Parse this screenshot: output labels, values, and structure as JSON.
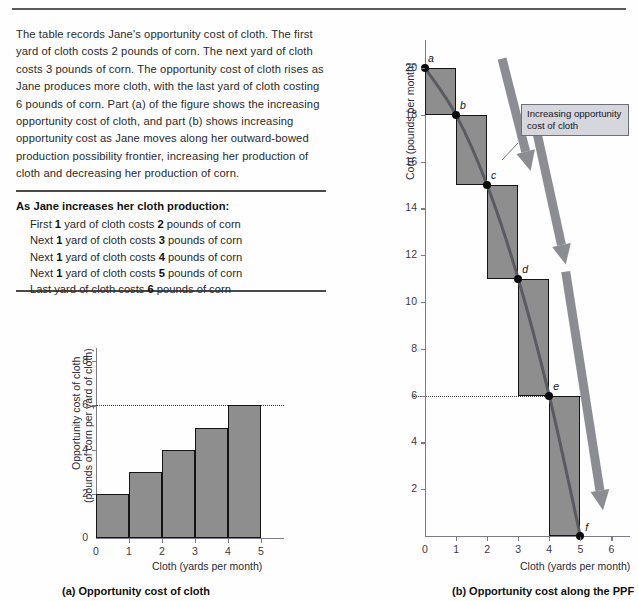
{
  "intro": {
    "paragraph": "The table records Jane's opportunity cost of cloth. The first yard of cloth costs 2 pounds of corn. The next yard of cloth costs 3 pounds of corn. The opportunity cost of cloth rises as Jane produces more cloth, with the last yard of cloth costing 6 pounds of corn. Part (a) of the figure shows the increasing opportunity cost of cloth, and part (b) shows increasing opportunity cost as Jane moves along her outward-bowed production possibility frontier, increasing her production of cloth and decreasing her production of corn."
  },
  "cost_table": {
    "heading": "As Jane increases her cloth production:",
    "rows": [
      {
        "prefix": "First",
        "qty": "1",
        "mid": "yard of cloth costs",
        "cost": "2",
        "suffix": "pounds of corn"
      },
      {
        "prefix": "Next",
        "qty": "1",
        "mid": "yard of cloth costs",
        "cost": "3",
        "suffix": "pounds of corn"
      },
      {
        "prefix": "Next",
        "qty": "1",
        "mid": "yard of cloth costs",
        "cost": "4",
        "suffix": "pounds of corn"
      },
      {
        "prefix": "Next",
        "qty": "1",
        "mid": "yard of cloth costs",
        "cost": "5",
        "suffix": "pounds of corn"
      },
      {
        "prefix": "Last",
        "qty": "",
        "mid": "yard of cloth costs",
        "cost": "6",
        "suffix": "pounds of corn"
      }
    ]
  },
  "panel_a": {
    "caption": "(a) Opportunity cost of cloth",
    "xlabel": "Cloth (yards per month)",
    "ylabel_line1": "Opportunity cost of cloth",
    "ylabel_line2": "(pounds of corn per yard of cloth)"
  },
  "panel_b": {
    "caption": "(b) Opportunity cost along the PPF",
    "xlabel": "Cloth (yards per month)",
    "ylabel": "Corn (pounds per month)",
    "callout": "Increasing opportunity cost of cloth"
  },
  "colors": {
    "bar_fill": "#8e8e8e",
    "bar_stroke": "#141414",
    "ppf_curve": "#5a5a62",
    "arrow": "#8c8c93",
    "callout_bg": "#d6d6dd",
    "axis": "#7b7b8a"
  },
  "chart_data": [
    {
      "type": "bar",
      "id": "panel-a",
      "title": "(a) Opportunity cost of cloth",
      "xlabel": "Cloth (yards per month)",
      "ylabel": "Opportunity cost of cloth (pounds of corn per yard of cloth)",
      "categories": [
        "0-1",
        "1-2",
        "2-3",
        "3-4",
        "4-5"
      ],
      "bar_intervals": [
        [
          0,
          1
        ],
        [
          1,
          2
        ],
        [
          2,
          3
        ],
        [
          3,
          4
        ],
        [
          4,
          5
        ]
      ],
      "values": [
        2,
        3,
        4,
        5,
        6
      ],
      "xlim": [
        0,
        5.7
      ],
      "ylim": [
        0,
        8.6
      ],
      "xticks": [
        0,
        1,
        2,
        3,
        4,
        5
      ],
      "yticks": [
        0,
        2,
        4,
        6,
        8
      ],
      "grid": false,
      "annotations": [
        {
          "kind": "dotted-hline",
          "y": 6
        }
      ]
    },
    {
      "type": "line",
      "id": "panel-b",
      "title": "(b) Opportunity cost along the PPF",
      "xlabel": "Cloth (yards per month)",
      "ylabel": "Corn (pounds per month)",
      "xlim": [
        0,
        6.6
      ],
      "ylim": [
        0,
        21.2
      ],
      "xticks": [
        0,
        1,
        2,
        3,
        4,
        5,
        6
      ],
      "yticks": [
        0,
        2,
        4,
        6,
        8,
        10,
        12,
        14,
        16,
        18,
        20
      ],
      "grid": false,
      "series": [
        {
          "name": "Production possibility frontier",
          "points": [
            {
              "label": "a",
              "x": 0,
              "y": 20
            },
            {
              "label": "b",
              "x": 1,
              "y": 18
            },
            {
              "label": "c",
              "x": 2,
              "y": 15
            },
            {
              "label": "d",
              "x": 3,
              "y": 11
            },
            {
              "label": "e",
              "x": 4,
              "y": 6
            },
            {
              "label": "f",
              "x": 5,
              "y": 0
            }
          ]
        }
      ],
      "step_rectangles": [
        {
          "x0": 0,
          "x1": 1,
          "y0": 18,
          "y1": 20,
          "cost": 2
        },
        {
          "x0": 1,
          "x1": 2,
          "y0": 15,
          "y1": 18,
          "cost": 3
        },
        {
          "x0": 2,
          "x1": 3,
          "y0": 11,
          "y1": 15,
          "cost": 4
        },
        {
          "x0": 3,
          "x1": 4,
          "y0": 6,
          "y1": 11,
          "cost": 5
        },
        {
          "x0": 4,
          "x1": 5,
          "y0": 0,
          "y1": 6,
          "cost": 6
        }
      ],
      "annotations": [
        {
          "kind": "dotted-hline",
          "y": 6
        },
        {
          "kind": "callout",
          "text": "Increasing opportunity cost of cloth"
        },
        {
          "kind": "arrow",
          "index": 1
        },
        {
          "kind": "arrow",
          "index": 2
        },
        {
          "kind": "arrow",
          "index": 3
        }
      ]
    }
  ]
}
